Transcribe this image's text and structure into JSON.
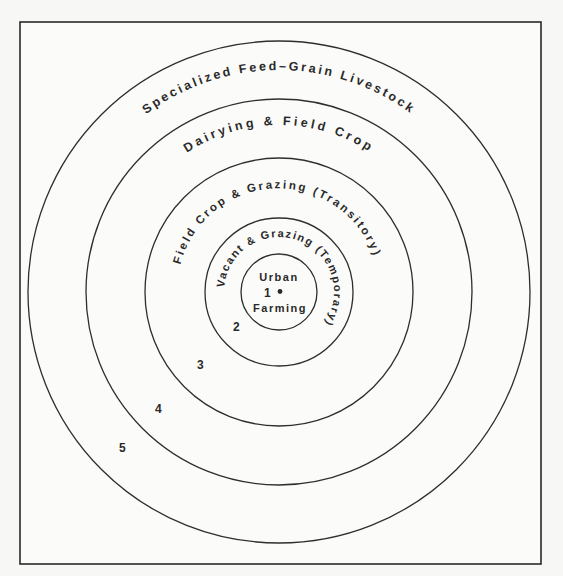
{
  "diagram": {
    "center": {
      "x": 279,
      "y": 292
    },
    "frame": {
      "x": 20,
      "y": 22,
      "width": 521,
      "height": 542
    },
    "zones": [
      {
        "number": "1",
        "label": "Urban Farming",
        "label_top": "Urban",
        "label_bottom": "Farming",
        "radius": 38
      },
      {
        "number": "2",
        "label": "Vacant & Grazing (Temporary)",
        "radius": 74
      },
      {
        "number": "3",
        "label": "Field Crop & Grazing (Transitory)",
        "radius": 134
      },
      {
        "number": "4",
        "label": "Dairying & Field Crop",
        "radius": 193
      },
      {
        "number": "5",
        "label": "Specialized Feed-Grain Livestock",
        "radius": 251
      }
    ],
    "arc_labels": {
      "zone5": "Specialized Feed–Grain Livestock",
      "zone4": "Dairying & Field Crop",
      "zone3": "Field Crop & Grazing (Transitory)",
      "zone2": "Vacant & Grazing (Temporary)"
    },
    "numbers": {
      "n1": "1",
      "n2": "2",
      "n3": "3",
      "n4": "4",
      "n5": "5"
    },
    "center_text": {
      "top": "Urban",
      "bottom": "Farming"
    }
  }
}
